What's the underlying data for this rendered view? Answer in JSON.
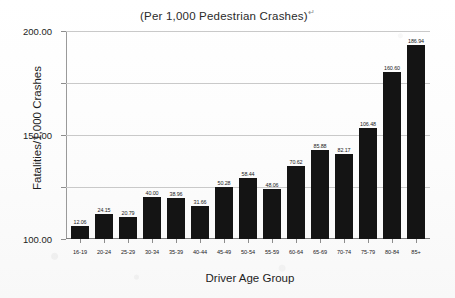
{
  "chart_data": {
    "type": "bar",
    "title": "(Per 1,000 Pedestrian Crashes)",
    "title_marker": "↵",
    "xlabel": "Driver Age Group",
    "ylabel": "Fatalities/1,000 Crashes",
    "categories": [
      "16-19",
      "20-24",
      "25-29",
      "30-34",
      "35-39",
      "40-44",
      "45-49",
      "50-54",
      "55-59",
      "60-64",
      "65-69",
      "70-74",
      "75-79",
      "80-84",
      "85+"
    ],
    "values": [
      12.06,
      24.15,
      20.79,
      40.0,
      38.96,
      31.66,
      50.28,
      58.44,
      48.06,
      70.62,
      85.88,
      82.17,
      106.48,
      160.6,
      186.94
    ],
    "value_labels": [
      "12.06",
      "24.15",
      "20.79",
      "40.00",
      "38.96",
      "31.66",
      "50.28",
      "58.44",
      "48.06",
      "70.62",
      "85.88",
      "82.17",
      "106.48",
      "160.60",
      "186.94"
    ],
    "ylim": [
      0,
      200
    ],
    "yticks": [
      0,
      50,
      100,
      150,
      200
    ],
    "ytick_labels": [
      "0.00",
      "50.00",
      "100.00",
      "150.00",
      "200.00"
    ],
    "grid": true,
    "legend": false,
    "bar_color": "#141414",
    "grid_color": "#c9c9c9",
    "axis_color": "#8d8d8d"
  }
}
